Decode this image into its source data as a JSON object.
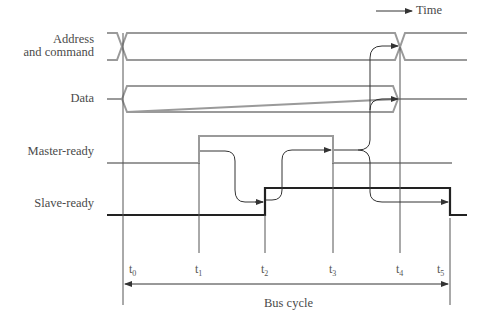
{
  "diagram": {
    "type": "timing-diagram",
    "time_label": "Time",
    "signals": [
      {
        "id": "address",
        "label_line1": "Address",
        "label_line2": "and command",
        "kind": "bus",
        "color": "#9a9a9a"
      },
      {
        "id": "data",
        "label": "Data",
        "kind": "bus",
        "color": "#9a9a9a"
      },
      {
        "id": "master_ready",
        "label": "Master-ready",
        "kind": "level",
        "color": "#9a9a9a"
      },
      {
        "id": "slave_ready",
        "label": "Slave-ready",
        "kind": "level",
        "color": "#222222"
      }
    ],
    "time_markers": [
      {
        "name": "t",
        "sub": "0"
      },
      {
        "name": "t",
        "sub": "1"
      },
      {
        "name": "t",
        "sub": "2"
      },
      {
        "name": "t",
        "sub": "3"
      },
      {
        "name": "t",
        "sub": "4"
      },
      {
        "name": "t",
        "sub": "5"
      }
    ],
    "span_label": "Bus cycle",
    "arrow_color": "#333333"
  }
}
